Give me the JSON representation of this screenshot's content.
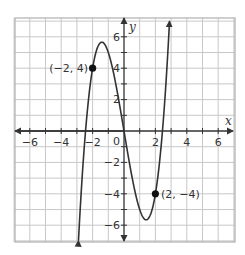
{
  "chart_data": {
    "type": "line",
    "title": "",
    "function": "f(x) = x^3 - 6x",
    "xlabel": "x",
    "ylabel": "y",
    "xlim": [
      -7,
      7
    ],
    "ylim": [
      -7,
      7
    ],
    "grid": true,
    "grid_step": 1,
    "x_ticks": [
      -6,
      -4,
      -2,
      2,
      4,
      6
    ],
    "y_ticks": [
      -6,
      -4,
      -2,
      2,
      4,
      6
    ],
    "x_tick_labels": [
      "−6",
      "−4",
      "−2",
      "2",
      "4",
      "6"
    ],
    "y_tick_labels": [
      "−6",
      "−4",
      "−2",
      "2",
      "4",
      "6"
    ],
    "origin_label": "0",
    "series": [
      {
        "name": "curve",
        "x": [
          -2.9,
          -2.5,
          -2,
          -1.414,
          -1,
          -0.5,
          0,
          0.5,
          1,
          1.414,
          2,
          2.5,
          2.9
        ],
        "y": [
          -6.99,
          -0.63,
          4,
          5.66,
          5,
          2.88,
          0,
          -2.88,
          -5,
          -5.66,
          -4,
          0.63,
          6.99
        ],
        "arrows": "both ends"
      }
    ],
    "labeled_points": [
      {
        "x": -2,
        "y": 4,
        "label": "(−2, 4)"
      },
      {
        "x": 2,
        "y": -4,
        "label": "(2, −4)"
      }
    ],
    "colors": {
      "curve": "#333333",
      "grid": "#c8c8c8",
      "axis": "#333333",
      "border": "#b0b0b0"
    }
  },
  "labels": {
    "x_axis": "x",
    "y_axis": "y",
    "origin": "0",
    "x_ticks": [
      "−6",
      "−4",
      "−2",
      "2",
      "4",
      "6"
    ],
    "y_ticks": [
      "6",
      "4",
      "2",
      "−2",
      "−4",
      "−6"
    ],
    "point_a": "(−2, 4)",
    "point_b": "(2, −4)"
  }
}
